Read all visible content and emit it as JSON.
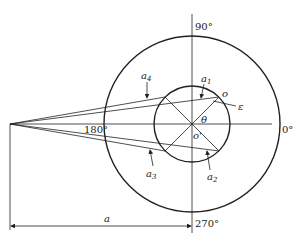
{
  "diagram": {
    "type": "geometric polar diagram",
    "angle_labels": {
      "deg0": "0°",
      "deg90": "90°",
      "deg180": "180°",
      "deg270": "270°"
    },
    "symbols": {
      "a1": {
        "base": "a",
        "sub": "1"
      },
      "a2": {
        "base": "a",
        "sub": "2"
      },
      "a3": {
        "base": "a",
        "sub": "3"
      },
      "a4": {
        "base": "a",
        "sub": "4"
      },
      "theta": "θ",
      "epsilon": "ε",
      "o": "o",
      "o_prime": "o'",
      "a": "a"
    },
    "dimension_label": "a",
    "colors": {
      "line": "#222222",
      "background": "#ffffff"
    }
  }
}
